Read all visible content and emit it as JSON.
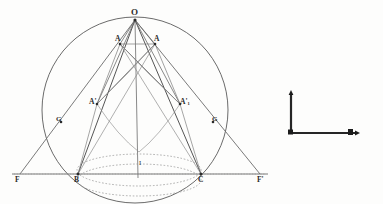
{
  "figure": {
    "kind": "geometry-diagram",
    "background_color": "#fdfdfc",
    "ink_color": "#3a3a3a",
    "light_ink_color": "#8a8a8a",
    "width": 383,
    "height": 204
  },
  "labels": {
    "apex": "O",
    "upper_left": "A",
    "upper_right": "A",
    "mid_left": "A'",
    "mid_right": "A'",
    "mid_right_sub": "1",
    "base_left": "B",
    "base_right": "C",
    "far_left": "F",
    "far_right": "F'",
    "tangent_left": "G",
    "tangent_right": "G",
    "center": "I"
  },
  "points": {
    "O": {
      "x": 135,
      "y": 20
    },
    "A": {
      "x": 120,
      "y": 44
    },
    "A1": {
      "x": 155,
      "y": 44
    },
    "Ap": {
      "x": 97,
      "y": 104
    },
    "Ap1": {
      "x": 180,
      "y": 104
    },
    "B": {
      "x": 78,
      "y": 174
    },
    "C": {
      "x": 201,
      "y": 174
    },
    "F": {
      "x": 20,
      "y": 174
    },
    "Fp": {
      "x": 260,
      "y": 174
    },
    "G": {
      "x": 61,
      "y": 122
    },
    "Gp": {
      "x": 213,
      "y": 122
    },
    "I": {
      "x": 139,
      "y": 166
    }
  },
  "circle": {
    "cx": 135,
    "cy": 110,
    "r": 93
  },
  "ellipses": {
    "upper": {
      "cx": 139,
      "cy": 170,
      "rx": 62,
      "ry": 16
    },
    "lower": {
      "cx": 139,
      "cy": 180,
      "rx": 62,
      "ry": 16
    }
  },
  "scale_figure": {
    "name": "L-shaped axis marker",
    "vertical_x": 291,
    "vertical_top_y": 92,
    "corner_y": 133,
    "horizontal_right_x": 357
  }
}
